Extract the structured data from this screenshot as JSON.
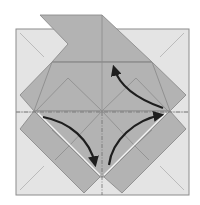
{
  "diagram": {
    "title": "Origami folding step",
    "type": "origami-crease-pattern",
    "colors": {
      "background": "#ffffff",
      "paper_light": "#e4e4e4",
      "paper_dark": "#b3b3b3",
      "edge": "#8c8c8c",
      "crease": "#9a9a9a",
      "arrow": "#1e1e1e",
      "mountain_fold_line": "#6e6e6e"
    },
    "arrows": [
      {
        "name": "arrow-upper-right",
        "direction": "up-left",
        "from": [
          164,
          111
        ],
        "to": [
          113,
          66
        ]
      },
      {
        "name": "arrow-left-down",
        "direction": "down-right",
        "from": [
          42,
          117
        ],
        "to": [
          96,
          165
        ]
      },
      {
        "name": "arrow-bottom-up",
        "direction": "up-right",
        "from": [
          109,
          165
        ],
        "to": [
          162,
          115
        ]
      }
    ],
    "fold_lines": [
      {
        "name": "horizontal-mountain-fold",
        "style": "dash-dot"
      },
      {
        "name": "vertical-mountain-fold",
        "style": "dash-dot"
      }
    ]
  }
}
